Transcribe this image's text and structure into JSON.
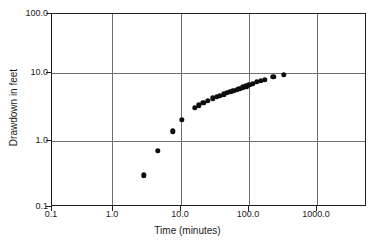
{
  "chart_data": {
    "type": "scatter",
    "title": "",
    "xlabel": "Time (minutes)",
    "ylabel": "Drawdown in feet",
    "xscale": "log",
    "yscale": "log",
    "xlim": [
      0.1,
      10000.0
    ],
    "ylim": [
      0.1,
      100.0
    ],
    "grid": true,
    "legend": null,
    "xticks": [
      {
        "value": 0.1,
        "label": "0.1"
      },
      {
        "value": 1.0,
        "label": "1.0"
      },
      {
        "value": 10.0,
        "label": "10.0"
      },
      {
        "value": 100.0,
        "label": "100.0"
      },
      {
        "value": 1000.0,
        "label": "1000.0"
      }
    ],
    "yticks": [
      {
        "value": 0.1,
        "label": "0.1"
      },
      {
        "value": 1.0,
        "label": "1.0"
      },
      {
        "value": 10.0,
        "label": "10.0"
      },
      {
        "value": 100.0,
        "label": "100.0"
      }
    ],
    "series": [
      {
        "name": "drawdown",
        "marker": "filled-circle",
        "color": "#0d0d0d",
        "x": [
          3.0,
          5.0,
          8.5,
          12.0,
          19.0,
          22.0,
          26.0,
          31.0,
          37.0,
          43.0,
          48.0,
          55.0,
          62.0,
          70.0,
          78.0,
          88.0,
          97.0,
          110.0,
          125.0,
          140.0,
          160.0,
          185.0,
          215.0,
          250.0,
          340.0,
          500.0
        ],
        "y": [
          0.3,
          0.72,
          1.45,
          2.2,
          3.35,
          3.7,
          4.0,
          4.3,
          4.7,
          5.0,
          5.2,
          5.45,
          5.7,
          5.95,
          6.2,
          6.45,
          6.7,
          7.0,
          7.3,
          7.6,
          8.0,
          8.45,
          8.9,
          9.2,
          10.2,
          11.0
        ]
      }
    ]
  }
}
